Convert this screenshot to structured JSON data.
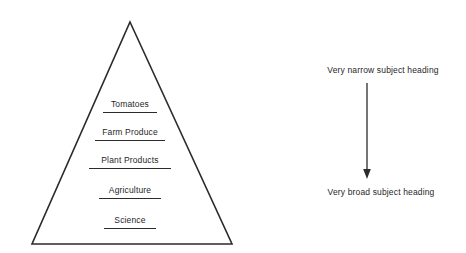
{
  "diagram": {
    "title_visible": false,
    "background_color": "#ffffff",
    "stroke_color": "#2b2b2b",
    "text_color": "#1f1f1f"
  },
  "pyramid": {
    "apex": {
      "x": 130,
      "y": 22
    },
    "base_left": {
      "x": 32,
      "y": 244
    },
    "base_right": {
      "x": 232,
      "y": 244
    },
    "tiers": [
      {
        "label": "Tomatoes",
        "center_x": 130,
        "y": 105,
        "underline_width": 54
      },
      {
        "label": "Farm Produce",
        "center_x": 130,
        "y": 132,
        "underline_width": 70
      },
      {
        "label": "Plant Products",
        "center_x": 130,
        "y": 160,
        "underline_width": 82
      },
      {
        "label": "Agriculture",
        "center_x": 130,
        "y": 190,
        "underline_width": 62
      },
      {
        "label": "Science",
        "center_x": 130,
        "y": 220,
        "underline_width": 52
      }
    ]
  },
  "annotation": {
    "top_label": "Very narrow subject heading",
    "bottom_label": "Very broad subject heading",
    "arrow": {
      "x": 367,
      "y_start": 83,
      "y_end": 178,
      "direction": "down"
    },
    "top_label_center_x": 383,
    "top_label_y": 65,
    "bottom_label_center_x": 381,
    "bottom_label_y": 187
  }
}
